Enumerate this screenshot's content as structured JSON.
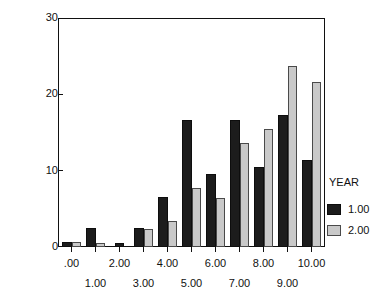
{
  "chart_data": {
    "type": "bar",
    "title": "",
    "xlabel": "",
    "ylabel": "Percentage of pupils",
    "ylim": [
      0,
      30
    ],
    "yticks": [
      0,
      10,
      20,
      30
    ],
    "ytick_labels": [
      "0",
      "10",
      "20",
      "30"
    ],
    "grid": false,
    "legend_position": "right",
    "legend_title": "YEAR",
    "categories": [
      ".00",
      "1.00",
      "2.00",
      "3.00",
      "4.00",
      "5.00",
      "6.00",
      "7.00",
      "8.00",
      "9.00",
      "10.00"
    ],
    "xtick_labels_top_row": [
      ".00",
      "2.00",
      "4.00",
      "6.00",
      "8.00",
      "10.00"
    ],
    "xtick_labels_bottom_row": [
      "1.00",
      "3.00",
      "5.00",
      "7.00",
      "9.00"
    ],
    "series": [
      {
        "name": "1.00",
        "color": "#1c1c1c",
        "values": [
          0.7,
          2.5,
          0.5,
          2.5,
          6.5,
          16.6,
          9.6,
          16.6,
          10.5,
          17.3,
          11.4
        ]
      },
      {
        "name": "2.00",
        "color": "#c9c9c9",
        "values": [
          0.7,
          0.5,
          0.0,
          2.4,
          3.4,
          7.7,
          6.4,
          13.6,
          15.5,
          23.7,
          21.6
        ]
      }
    ]
  },
  "axes": {
    "y_title": "Percentage of pupils"
  },
  "legend": {
    "title": "YEAR",
    "items": [
      {
        "label": "1.00",
        "color": "#1c1c1c"
      },
      {
        "label": "2.00",
        "color": "#c9c9c9"
      }
    ]
  }
}
